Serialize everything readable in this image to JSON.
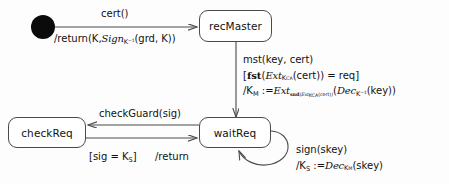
{
  "diagram": {
    "type": "state-machine",
    "title": "",
    "background_color": "#fdfdfd",
    "line_color": "#4a4a4a",
    "text_color": "#111111"
  },
  "states": [
    {
      "id": "initial",
      "label": "",
      "kind": "initial-pseudostate"
    },
    {
      "id": "recMaster",
      "label": "recMaster",
      "kind": "state"
    },
    {
      "id": "waitReq",
      "label": "waitReq",
      "kind": "state"
    },
    {
      "id": "checkReq",
      "label": "checkReq",
      "kind": "state"
    }
  ],
  "transitions": {
    "init_to_recmaster": {
      "trigger": "cert()",
      "effect_plain": "/return(K, Sign_{K^-1}(grd, K))",
      "effect_prefix": "/return(K,",
      "effect_fn": "Sign",
      "effect_fn_sub": "K",
      "effect_fn_sup": "−1",
      "effect_args": "(grd, K))"
    },
    "recmaster_to_waitreq": {
      "trigger": "mst(key, cert)",
      "guard_plain": "[fst(Ext_{K_CA}(cert)) = req]",
      "guard_open": "[",
      "guard_bf": "fst",
      "guard_p1": "(",
      "guard_ext": "Ext",
      "guard_ext_sub": "K",
      "guard_ext_sub2": "CA",
      "guard_mid": "(cert)) = req",
      "guard_close": "]",
      "effect_plain": "/K_M := Ext_{snd(Ext_{K_CA}(cert))}(Dec_{K^-1}(key))",
      "effect_lhs": "/K",
      "effect_lhs_sub": "M",
      "effect_assign": ":=",
      "effect_ext": "Ext",
      "effect_ext_sub_bf": "snd",
      "effect_ext_sub_inner": "Ext",
      "effect_ext_sub_inner_sub": "K",
      "effect_ext_sub_inner_sub2": "CA",
      "effect_ext_sub_tail": "(cert))",
      "effect_dec": "Dec",
      "effect_dec_sub": "K",
      "effect_dec_sup": "−1",
      "effect_dec_arg": "(key))"
    },
    "waitreq_to_checkreq": {
      "trigger": "checkGuard(sig)"
    },
    "checkreq_to_waitreq": {
      "guard_plain": "[sig = K_S]",
      "guard_open": "[sig = K",
      "guard_sub": "S",
      "guard_close": "]",
      "effect": "/return"
    },
    "waitreq_self_loop": {
      "trigger": "sign(skey)",
      "effect_plain": "/K_S := Dec_{K_M}(skey)",
      "effect_lhs": "/K",
      "effect_lhs_sub": "S",
      "effect_assign": ":=",
      "effect_dec": "Dec",
      "effect_dec_sub": "K",
      "effect_dec_sub2": "M",
      "effect_arg": "(skey)"
    }
  }
}
